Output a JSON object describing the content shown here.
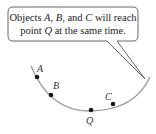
{
  "callout": {
    "line1_parts": [
      "Objects ",
      "A",
      ", ",
      "B",
      ", and ",
      "C",
      " will reach"
    ],
    "line2_parts": [
      "point ",
      "Q",
      " at the same time."
    ]
  },
  "points": [
    {
      "id": "A",
      "label": "A"
    },
    {
      "id": "B",
      "label": "B"
    },
    {
      "id": "C",
      "label": "C"
    },
    {
      "id": "Q",
      "label": "Q"
    }
  ],
  "colors": {
    "arc": "#9a9a9a",
    "point": "#1a1a1a",
    "bubble_stroke": "#555555"
  }
}
